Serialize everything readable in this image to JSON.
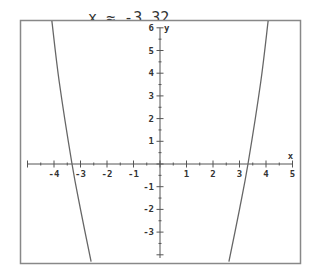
{
  "header": {
    "clipped_text_left": "x ≈ -3.32,",
    "clipped_text_right": "x ≈ 3.32"
  },
  "chart_data": {
    "type": "line",
    "title": "",
    "xlabel": "x",
    "ylabel": "y",
    "xlim": [
      -5.27,
      5.3
    ],
    "ylim": [
      -4.4,
      6.34
    ],
    "x_ticks": [
      -4,
      -3,
      -2,
      -1,
      1,
      2,
      3,
      4,
      5
    ],
    "y_ticks": [
      6,
      5,
      4,
      3,
      2,
      1,
      -1,
      -2,
      -3
    ],
    "grid": false,
    "legend": null,
    "annotations": [
      "roots at x ≈ -3.32 and x ≈ 3.32"
    ],
    "series": [
      {
        "name": "f(x)",
        "description": "even quartic-like curve with x-intercepts at ±3.32",
        "roots": [
          -3.32,
          3.32
        ],
        "points": [
          {
            "x": -4.08,
            "y": 6.3
          },
          {
            "x": -3.8,
            "y": 3.6
          },
          {
            "x": -3.32,
            "y": 0
          },
          {
            "x": -3.0,
            "y": -2.0
          },
          {
            "x": -2.6,
            "y": -4.3
          },
          {
            "x": 2.6,
            "y": -4.3
          },
          {
            "x": 3.0,
            "y": -2.0
          },
          {
            "x": 3.32,
            "y": 0
          },
          {
            "x": 3.8,
            "y": 3.6
          },
          {
            "x": 4.08,
            "y": 6.3
          }
        ]
      }
    ]
  },
  "colors": {
    "frame": "#888888",
    "axis": "#555555",
    "curve": "#666666",
    "text": "#333333"
  }
}
